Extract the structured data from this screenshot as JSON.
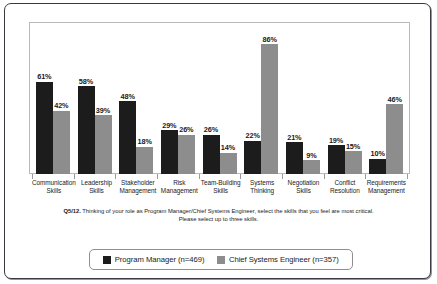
{
  "chart_data": {
    "type": "bar",
    "title": "",
    "subtitle": "",
    "xlabel": "",
    "ylabel": "",
    "ylim": [
      0,
      100
    ],
    "grid": false,
    "legend_position": "bottom",
    "value_suffix": "%",
    "categories": [
      "Communication\nSkills",
      "Leadership\nSkills",
      "Stakeholder\nManagement",
      "Risk\nManagement",
      "Team-Building\nSkills",
      "Systems\nThinking",
      "Negotiation\nSkills",
      "Conflict\nResolution",
      "Requirements\nManagement"
    ],
    "series": [
      {
        "name": "Program Manager (n=469)",
        "color": "#1c1c1c",
        "values": [
          61,
          58,
          48,
          29,
          26,
          22,
          21,
          19,
          10
        ],
        "labels": [
          "61%",
          "58%",
          "48%",
          "29%",
          "26%",
          "22%",
          "21%",
          "19%",
          "10%"
        ]
      },
      {
        "name": "Chief Systems Engineer (n=357)",
        "color": "#8d8d8d",
        "values": [
          42,
          39,
          18,
          26,
          14,
          86,
          9,
          15,
          46
        ],
        "labels": [
          "42%",
          "39%",
          "18%",
          "26%",
          "14%",
          "86%",
          "9%",
          "15%",
          "46%"
        ]
      }
    ],
    "annotations": {
      "question_number": "Q5/12.",
      "question_line1": "Thinking of your role as Program Manager/Chief Systems Engineer, select the skills that you feel are most critical.",
      "question_line2": "Please select up to three skills."
    },
    "legend": [
      {
        "label": "Program Manager (n=469)",
        "color": "#1c1c1c"
      },
      {
        "label": "Chief Systems Engineer (n=357)",
        "color": "#8d8d8d"
      }
    ]
  }
}
